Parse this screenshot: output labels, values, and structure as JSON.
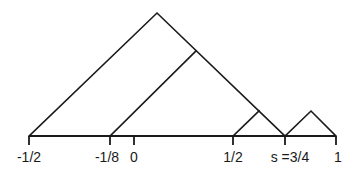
{
  "diagram": {
    "type": "tent-map-triangles",
    "axis": {
      "ticks": [
        {
          "value": -0.5,
          "label": "-1/2",
          "px": 29
        },
        {
          "value": -0.125,
          "label": "-1/8",
          "px": 110
        },
        {
          "value": 0,
          "label": "0",
          "px": 134
        },
        {
          "value": 0.5,
          "label": "1/2",
          "px": 233
        },
        {
          "value": 0.75,
          "label": "s =3/4",
          "px": 285
        },
        {
          "value": 1,
          "label": "1",
          "px": 336
        }
      ]
    },
    "labels": {
      "neg_half": "-1/2",
      "neg_eighth": "-1/8",
      "zero": "0",
      "half": "1/2",
      "s_three_quarters": "s =3/4",
      "one": "1"
    },
    "shapes": [
      {
        "name": "large-triangle",
        "from": "-1/2",
        "to": "3/4"
      },
      {
        "name": "inner-line",
        "from": "-1/8",
        "to": "right-edge-of-large-triangle"
      },
      {
        "name": "small-triangle-left",
        "from": "1/2",
        "to": "3/4"
      },
      {
        "name": "small-triangle-right",
        "from": "3/4",
        "to": "1"
      }
    ],
    "colors": {
      "stroke": "#1a1a1a",
      "background": "#ffffff"
    }
  }
}
